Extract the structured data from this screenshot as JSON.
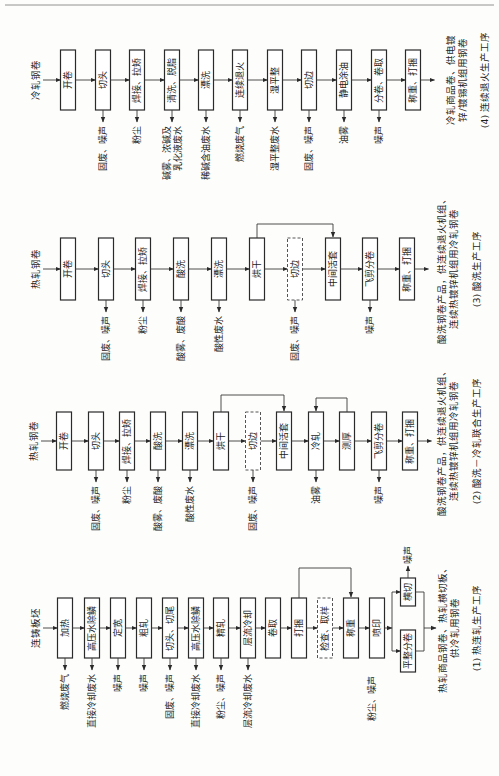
{
  "diagrams": [
    {
      "id": "4",
      "input": "冷轧钢卷",
      "steps": [
        "开卷",
        "切头",
        "焊接、拉矫",
        "清洗、脱脂",
        "漂洗",
        "连续退火",
        "湿平整",
        "切边",
        "静电涂油",
        "分卷、卷取",
        "称重、打捆"
      ],
      "emissions": [
        "",
        "固废、噪声",
        "粉尘",
        "碱雾、浓碱及|乳化液废水",
        "稀碱含油废水",
        "燃烧废气",
        "湿平整废水",
        "固废、噪声",
        "油雾",
        "噪声",
        ""
      ],
      "output": "冷轧商品卷、供电镀|锌/镀锡机组用钢卷",
      "caption": "(4) 连续退火生产工序"
    },
    {
      "id": "3",
      "input": "热轧钢卷",
      "steps": [
        "开卷",
        "切头",
        "焊接、拉矫",
        "酸洗",
        "漂洗",
        "烘干",
        "切边",
        "中间活套",
        "飞剪分卷",
        "称重、打捆"
      ],
      "dashed": [
        6
      ],
      "emissions": [
        "",
        "固废、噪声",
        "粉尘",
        "酸雾、废酸",
        "酸性废水",
        "",
        "固废、噪声",
        "",
        "噪声",
        ""
      ],
      "output": "酸洗钢卷产品，供连续退火机组、|连续热镀锌机组用冷轧钢卷",
      "caption": "(3) 酸洗生产工序"
    },
    {
      "id": "2",
      "input": "热轧钢卷",
      "steps": [
        "开卷",
        "切头",
        "焊接、拉矫",
        "酸洗",
        "漂洗",
        "烘干",
        "切边",
        "中间活套",
        "冷轧",
        "测厚",
        "飞剪分卷",
        "称重、打捆"
      ],
      "dashed": [
        6
      ],
      "emissions": [
        "",
        "固废、噪声",
        "粉尘",
        "酸雾、废酸",
        "酸性废水",
        "",
        "固废、噪声",
        "",
        "油雾",
        "",
        "噪声",
        ""
      ],
      "output": "酸洗钢卷产品，供连续退火机组、|连续热镀锌机组用冷轧钢卷",
      "caption": "(2) 酸洗－冷轧联合生产工序"
    },
    {
      "id": "1",
      "input": "连铸板坯",
      "steps": [
        "加热",
        "高压水除鳞",
        "定宽",
        "粗轧",
        "切头、切尾",
        "高压水除鳞",
        "精轧",
        "层流冷却",
        "卷取",
        "打捆",
        "检查、取样",
        "称重",
        "喷印"
      ],
      "dashed": [
        10
      ],
      "branches": [
        "横切",
        "平整分卷"
      ],
      "emissions": [
        "燃烧废气",
        "直接冷却废水",
        "噪声",
        "噪声",
        "固废、噪声",
        "直接冷却废水",
        "粉尘、噪声",
        "层流冷却废水",
        "",
        "",
        "",
        "",
        ""
      ],
      "branch_emissions": [
        "噪声",
        "粉尘、噪声"
      ],
      "output": "热轧商品钢卷、热轧横切板、|供冷轧用钢卷",
      "caption": "(1) 热连轧生产工序"
    }
  ]
}
